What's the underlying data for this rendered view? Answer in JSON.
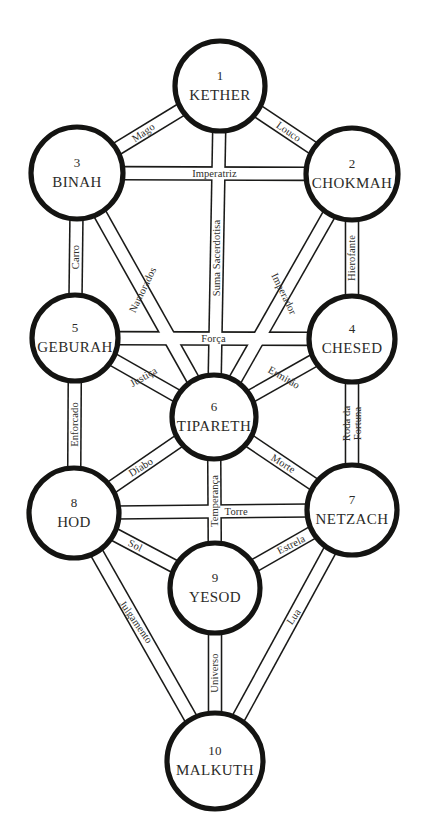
{
  "diagram": {
    "background_color": "#ffffff",
    "ink_color": "#1a1a18",
    "text_color": "#2b2b28"
  },
  "sephiroth": [
    {
      "id": "kether",
      "number": "1",
      "name": "KETHER",
      "cx": 220,
      "cy": 86,
      "r": 45
    },
    {
      "id": "chokmah",
      "number": "2",
      "name": "CHOKMAH",
      "cx": 352,
      "cy": 174,
      "r": 46
    },
    {
      "id": "binah",
      "number": "3",
      "name": "BINAH",
      "cx": 77,
      "cy": 173,
      "r": 46
    },
    {
      "id": "chesed",
      "number": "4",
      "name": "CHESED",
      "cx": 352,
      "cy": 339,
      "r": 43
    },
    {
      "id": "geburah",
      "number": "5",
      "name": "GEBURAH",
      "cx": 75,
      "cy": 338,
      "r": 43
    },
    {
      "id": "tiphareth",
      "number": "6",
      "name": "TIPARETH",
      "cx": 214,
      "cy": 417,
      "r": 42
    },
    {
      "id": "netzach",
      "number": "7",
      "name": "NETZACH",
      "cx": 352,
      "cy": 510,
      "r": 45
    },
    {
      "id": "hod",
      "number": "8",
      "name": "HOD",
      "cx": 74,
      "cy": 513,
      "r": 45
    },
    {
      "id": "yesod",
      "number": "9",
      "name": "YESOD",
      "cx": 215,
      "cy": 588,
      "r": 45
    },
    {
      "id": "malkuth",
      "number": "10",
      "name": "MALKUTH",
      "cx": 215,
      "cy": 761,
      "r": 48
    }
  ],
  "paths": [
    {
      "id": "mago",
      "label": "Mago",
      "from": "binah",
      "to": "kether",
      "label_lines": [
        "Mago"
      ],
      "t": 0.42,
      "rot": -35,
      "size": "normal"
    },
    {
      "id": "louco",
      "label": "Louco",
      "from": "kether",
      "to": "chokmah",
      "label_lines": [
        "Louco"
      ],
      "t": 0.55,
      "rot": 35,
      "size": "normal"
    },
    {
      "id": "imperatriz",
      "label": "Imperatriz",
      "from": "binah",
      "to": "chokmah",
      "label_lines": [
        "Imperatriz"
      ],
      "t": 0.5,
      "rot": 0,
      "size": "normal"
    },
    {
      "id": "suma-sacerdotisa",
      "label": "Suma Sacerdotisa",
      "from": "kether",
      "to": "tiphareth",
      "label_lines": [
        "Suma Sacerdotisa"
      ],
      "t": 0.52,
      "rot": -90,
      "size": "normal"
    },
    {
      "id": "carro",
      "label": "Carro",
      "from": "binah",
      "to": "geburah",
      "label_lines": [
        "Carro"
      ],
      "t": 0.5,
      "rot": -90,
      "size": "normal"
    },
    {
      "id": "hierofante",
      "label": "Hierofante",
      "from": "chokmah",
      "to": "chesed",
      "label_lines": [
        "Hierofante"
      ],
      "t": 0.5,
      "rot": -90,
      "size": "normal"
    },
    {
      "id": "namorados",
      "label": "Namorados",
      "from": "binah",
      "to": "tiphareth",
      "label_lines": [
        "Namorados"
      ],
      "t": 0.46,
      "rot": -64,
      "size": "normal"
    },
    {
      "id": "imperador",
      "label": "Imperador",
      "from": "chokmah",
      "to": "tiphareth",
      "label_lines": [
        "Imperador"
      ],
      "t": 0.48,
      "rot": 64,
      "size": "normal"
    },
    {
      "id": "forca",
      "label": "Força",
      "from": "geburah",
      "to": "chesed",
      "label_lines": [
        "Força"
      ],
      "t": 0.5,
      "rot": 0,
      "size": "normal"
    },
    {
      "id": "justica",
      "label": "Justiça",
      "from": "geburah",
      "to": "tiphareth",
      "label_lines": [
        "Justiça"
      ],
      "t": 0.48,
      "rot": -30,
      "size": "normal"
    },
    {
      "id": "ermitao",
      "label": "Ermitão",
      "from": "chesed",
      "to": "tiphareth",
      "label_lines": [
        "Ermitão"
      ],
      "t": 0.48,
      "rot": 30,
      "size": "normal"
    },
    {
      "id": "enforcado",
      "label": "Enforcado",
      "from": "geburah",
      "to": "hod",
      "label_lines": [
        "Enforcado"
      ],
      "t": 0.5,
      "rot": -90,
      "size": "normal"
    },
    {
      "id": "roda-da-fortuna",
      "label": "Roda da Fortuna",
      "from": "chesed",
      "to": "netzach",
      "label_lines": [
        "Roda da",
        "Fortuna"
      ],
      "t": 0.5,
      "rot": -90,
      "size": "normal"
    },
    {
      "id": "diabo",
      "label": "Diabo",
      "from": "hod",
      "to": "tiphareth",
      "label_lines": [
        "Diabo"
      ],
      "t": 0.44,
      "rot": -32,
      "size": "normal"
    },
    {
      "id": "morte",
      "label": "Morte",
      "from": "tiphareth",
      "to": "netzach",
      "label_lines": [
        "Morte"
      ],
      "t": 0.52,
      "rot": 32,
      "size": "normal"
    },
    {
      "id": "temperanca",
      "label": "Temperança",
      "from": "tiphareth",
      "to": "yesod",
      "label_lines": [
        "Temperança"
      ],
      "t": 0.5,
      "rot": -90,
      "size": "normal"
    },
    {
      "id": "torre",
      "label": "Torre",
      "from": "hod",
      "to": "netzach",
      "label_lines": [
        "Torre"
      ],
      "t": 0.62,
      "rot": 0,
      "size": "normal"
    },
    {
      "id": "sol",
      "label": "Sol",
      "from": "hod",
      "to": "yesod",
      "label_lines": [
        "Sol"
      ],
      "t": 0.36,
      "rot": 27,
      "size": "normal"
    },
    {
      "id": "estrela",
      "label": "Estrela",
      "from": "yesod",
      "to": "netzach",
      "label_lines": [
        "Estrela"
      ],
      "t": 0.62,
      "rot": -27,
      "size": "normal"
    },
    {
      "id": "julgamento",
      "label": "Julgamento",
      "from": "hod",
      "to": "malkuth",
      "label_lines": [
        "Julgamento"
      ],
      "t": 0.42,
      "rot": 55,
      "size": "normal"
    },
    {
      "id": "lua",
      "label": "Lua",
      "from": "netzach",
      "to": "malkuth",
      "label_lines": [
        "Lua"
      ],
      "t": 0.4,
      "rot": -55,
      "size": "normal"
    },
    {
      "id": "universo",
      "label": "Universo",
      "from": "yesod",
      "to": "malkuth",
      "label_lines": [
        "Universo"
      ],
      "t": 0.5,
      "rot": -90,
      "size": "normal"
    }
  ]
}
